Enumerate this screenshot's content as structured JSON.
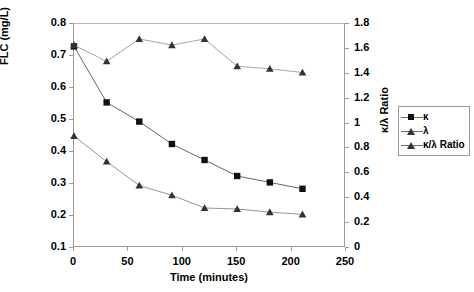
{
  "chart_data": {
    "type": "line",
    "title": "",
    "xlabel": "Time (minutes)",
    "ylabel": "FLC (mg/L)",
    "y2label": "κ/λ Ratio",
    "x": [
      0,
      30,
      60,
      90,
      120,
      150,
      180,
      210
    ],
    "xlim": [
      0,
      250
    ],
    "ylim": [
      0.1,
      0.8
    ],
    "y2lim": [
      0,
      1.8
    ],
    "xticks": [
      0,
      50,
      100,
      150,
      200,
      250
    ],
    "yticks": [
      0.1,
      0.2,
      0.3,
      0.4,
      0.5,
      0.6,
      0.7,
      0.8
    ],
    "y2ticks": [
      0,
      0.2,
      0.4,
      0.6,
      0.8,
      1,
      1.2,
      1.4,
      1.6,
      1.8
    ],
    "xtick_labels": [
      "0",
      "50",
      "100",
      "150",
      "200",
      "250"
    ],
    "ytick_labels": [
      "0.1",
      "0.2",
      "0.3",
      "0.4",
      "0.5",
      "0.6",
      "0.7",
      "0.8"
    ],
    "y2tick_labels": [
      "0",
      "0.2",
      "0.4",
      "0.6",
      "0.8",
      "1",
      "1.2",
      "1.4",
      "1.6",
      "1.8"
    ],
    "grid": false,
    "legend_position": "right",
    "series": [
      {
        "name": "κ",
        "axis": "left",
        "marker": "square",
        "color": "#111111",
        "line_color": "#555555",
        "values": [
          0.73,
          0.555,
          0.495,
          0.425,
          0.375,
          0.325,
          0.305,
          0.285
        ]
      },
      {
        "name": "λ",
        "axis": "left",
        "marker": "triangle",
        "color": "#333333",
        "line_color": "#8a8a8a",
        "values": [
          0.45,
          0.37,
          0.295,
          0.265,
          0.225,
          0.222,
          0.212,
          0.205
        ]
      },
      {
        "name": "κ/λ Ratio",
        "axis": "right",
        "marker": "triangle",
        "color": "#333333",
        "line_color": "#9a9a9a",
        "values": [
          1.63,
          1.5,
          1.68,
          1.63,
          1.68,
          1.46,
          1.44,
          1.41
        ]
      }
    ]
  },
  "legend": {
    "items": [
      {
        "label": "κ",
        "marker": "square"
      },
      {
        "label": "λ",
        "marker": "triangle"
      },
      {
        "label": "κ/λ Ratio",
        "marker": "triangle"
      }
    ]
  }
}
